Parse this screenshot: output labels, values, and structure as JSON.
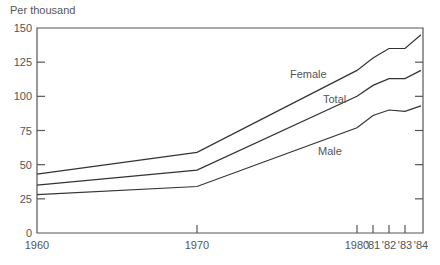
{
  "chart_data": {
    "type": "line",
    "title": "",
    "ylabel": "Per thousand",
    "xlabel": "",
    "ylim": [
      0,
      150
    ],
    "yticks": [
      0,
      25,
      50,
      75,
      100,
      125,
      150
    ],
    "x": [
      1960,
      1970,
      1980,
      1981,
      1982,
      1983,
      1984
    ],
    "xtick_labels": [
      "1960",
      "1970",
      "1980",
      "'81",
      "'82",
      "'83",
      "'84"
    ],
    "grid": false,
    "legend": "inline labels",
    "series": [
      {
        "name": "Female",
        "values": [
          43,
          59,
          119,
          128,
          135,
          135,
          145
        ]
      },
      {
        "name": "Total",
        "values": [
          35,
          46,
          100,
          108,
          113,
          113,
          119
        ]
      },
      {
        "name": "Male",
        "values": [
          28,
          34,
          77,
          86,
          90,
          89,
          93
        ]
      }
    ]
  },
  "labels": {
    "ylabel": "Per thousand",
    "female": "Female",
    "total": "Total",
    "male": "Male"
  },
  "colors": {
    "line": "#333333",
    "axis": "#555555",
    "text": "#555555"
  }
}
